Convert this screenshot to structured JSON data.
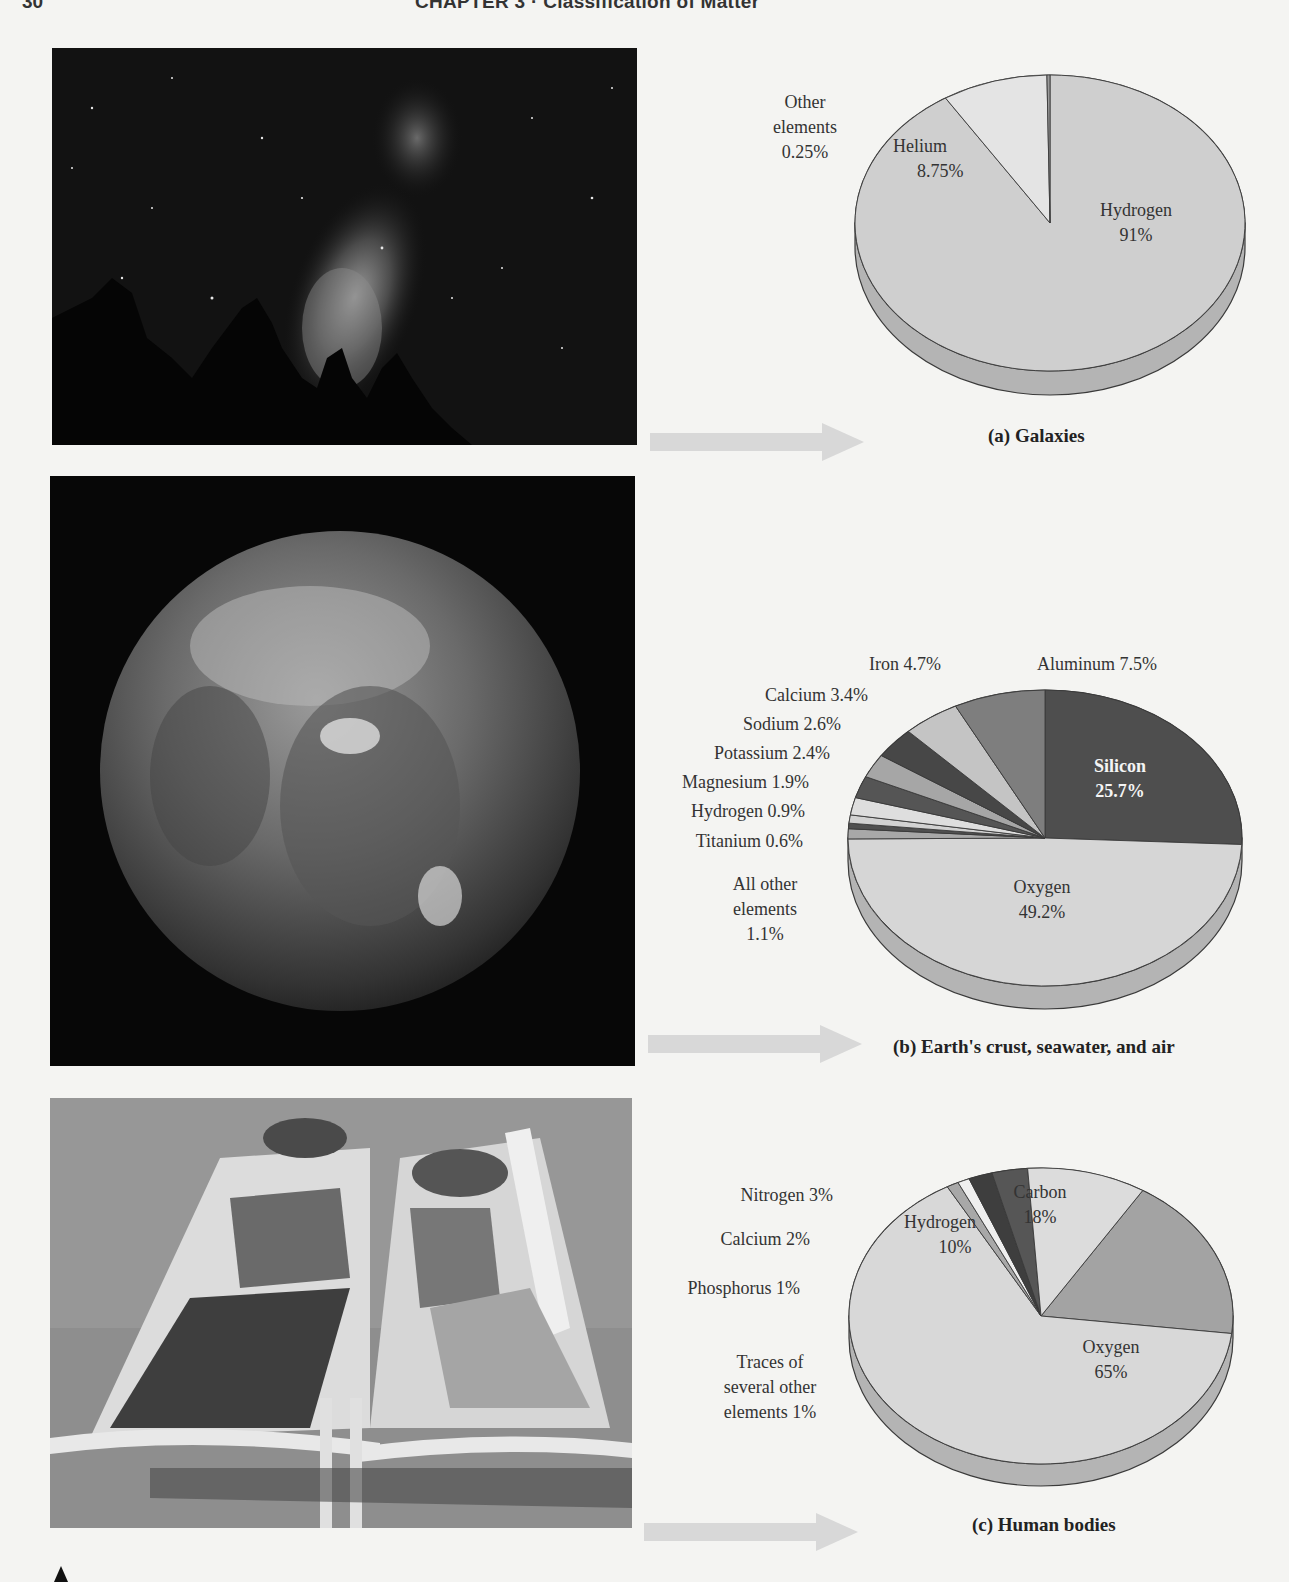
{
  "page": {
    "page_number": "30",
    "running_head": "CHAPTER 3 · Classification of Matter"
  },
  "photos": [
    {
      "name": "photo-galaxy",
      "description": "Milky Way night sky above silhouetted trees"
    },
    {
      "name": "photo-earth",
      "description": "Earth viewed from space"
    },
    {
      "name": "photo-sunbathers",
      "description": "Two people sunbathing on lounge chairs"
    }
  ],
  "chart_data": [
    {
      "type": "pie",
      "title": "(a) Galaxies",
      "categories": [
        "Hydrogen",
        "Helium",
        "Other elements"
      ],
      "values": [
        91,
        8.75,
        0.25
      ],
      "labels": [
        {
          "name": "Hydrogen",
          "text": "Hydrogen",
          "value": "91%"
        },
        {
          "name": "Helium",
          "text": "Helium",
          "value": "8.75%"
        },
        {
          "name": "Other elements",
          "text_line1": "Other",
          "text_line2": "elements",
          "value": "0.25%"
        }
      ],
      "colors": [
        "#cfcfcf",
        "#e4e4e4",
        "#9a9a9a"
      ],
      "legend": "none (callout labels)",
      "style": "3D pie"
    },
    {
      "type": "pie",
      "title": "(b) Earth's crust, seawater, and air",
      "categories": [
        "Silicon",
        "Oxygen",
        "All other elements",
        "Titanium",
        "Hydrogen",
        "Magnesium",
        "Potassium",
        "Sodium",
        "Calcium",
        "Iron",
        "Aluminum"
      ],
      "values": [
        25.7,
        49.2,
        1.1,
        0.6,
        0.9,
        1.9,
        2.4,
        2.6,
        3.4,
        4.7,
        7.5
      ],
      "labels": [
        {
          "name": "Silicon",
          "text": "Silicon",
          "value": "25.7%"
        },
        {
          "name": "Oxygen",
          "text": "Oxygen",
          "value": "49.2%"
        },
        {
          "name": "All other elements",
          "text_line1": "All other",
          "text_line2": "elements",
          "value": "1.1%"
        },
        {
          "name": "Titanium",
          "text": "Titanium 0.6%"
        },
        {
          "name": "Hydrogen",
          "text": "Hydrogen 0.9%"
        },
        {
          "name": "Magnesium",
          "text": "Magnesium 1.9%"
        },
        {
          "name": "Potassium",
          "text": "Potassium 2.4%"
        },
        {
          "name": "Sodium",
          "text": "Sodium 2.6%"
        },
        {
          "name": "Calcium",
          "text": "Calcium 3.4%"
        },
        {
          "name": "Iron",
          "text": "Iron 4.7%"
        },
        {
          "name": "Aluminum",
          "text": "Aluminum 7.5%"
        }
      ],
      "colors": [
        "#4e4e4e",
        "#d6d6d6",
        "#a8a8a8",
        "#505050",
        "#d2d2d2",
        "#dedede",
        "#555555",
        "#a6a6a6",
        "#474747",
        "#c4c4c4",
        "#7e7e7e"
      ],
      "legend": "none (callout labels)",
      "style": "3D pie"
    },
    {
      "type": "pie",
      "title": "(c) Human bodies",
      "categories": [
        "Carbon",
        "Oxygen",
        "Traces of several other elements",
        "Phosphorus",
        "Calcium",
        "Nitrogen",
        "Hydrogen"
      ],
      "values": [
        18,
        65,
        1,
        1,
        2,
        3,
        10
      ],
      "labels": [
        {
          "name": "Carbon",
          "text": "Carbon",
          "value": "18%"
        },
        {
          "name": "Oxygen",
          "text": "Oxygen",
          "value": "65%"
        },
        {
          "name": "Traces",
          "text_line1": "Traces of",
          "text_line2": "several other",
          "text_line3": "elements 1%"
        },
        {
          "name": "Phosphorus",
          "text": "Phosphorus 1%"
        },
        {
          "name": "Calcium",
          "text": "Calcium 2%"
        },
        {
          "name": "Nitrogen",
          "text": "Nitrogen 3%"
        },
        {
          "name": "Hydrogen",
          "text": "Hydrogen",
          "value": "10%"
        }
      ],
      "colors": [
        "#a3a3a3",
        "#d8d8d8",
        "#a8a8a8",
        "#efefef",
        "#3e3e3e",
        "#565656",
        "#dcdcdc"
      ],
      "legend": "none (callout labels)",
      "style": "3D pie"
    }
  ],
  "pie_geometry": [
    {
      "cx": 1050,
      "cy": 223,
      "rx": 195,
      "ry": 148,
      "depth": 24,
      "start_deg": -90,
      "direction": "clockwise_from_first"
    },
    {
      "cx": 1045,
      "cy": 838,
      "rx": 197,
      "ry": 148,
      "depth": 23,
      "start_deg": -90,
      "direction": "clockwise_from_first"
    },
    {
      "cx": 1041,
      "cy": 1316,
      "rx": 192,
      "ry": 148,
      "depth": 22,
      "start_deg": -58,
      "direction": "clockwise_from_first"
    }
  ],
  "colors": {
    "page_bg": "#f4f4f2",
    "rim": "#b4b4b4",
    "outline": "#3a3a3a",
    "arrow": "#d8d8d8"
  }
}
